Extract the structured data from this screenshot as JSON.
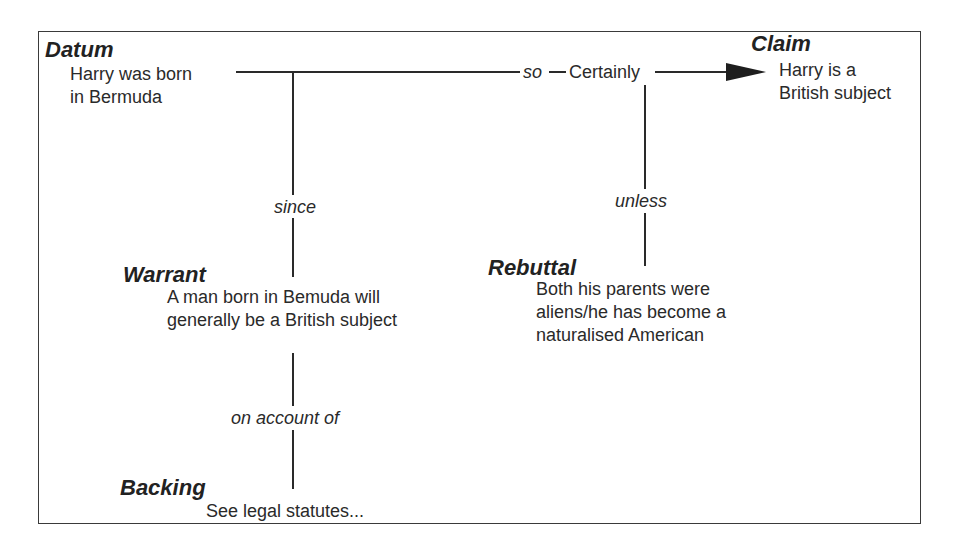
{
  "diagram": {
    "type": "Toulmin argument model",
    "datum": {
      "heading": "Datum",
      "text": "Harry was born\nin Bermuda"
    },
    "claim": {
      "heading": "Claim",
      "text": "Harry is a\nBritish subject"
    },
    "qualifier": {
      "connector": "so",
      "text": "Certainly"
    },
    "warrant": {
      "heading": "Warrant",
      "connector": "since",
      "text": "A man born in Bemuda will\ngenerally be a British subject"
    },
    "rebuttal": {
      "heading": "Rebuttal",
      "connector": "unless",
      "text": "Both his parents were\naliens/he has become a\nnaturalised American"
    },
    "backing": {
      "heading": "Backing",
      "connector": "on account of",
      "text": "See legal statutes..."
    },
    "colors": {
      "line": "#2a2a2a",
      "text": "#2a2a2a",
      "background": "#ffffff"
    }
  }
}
